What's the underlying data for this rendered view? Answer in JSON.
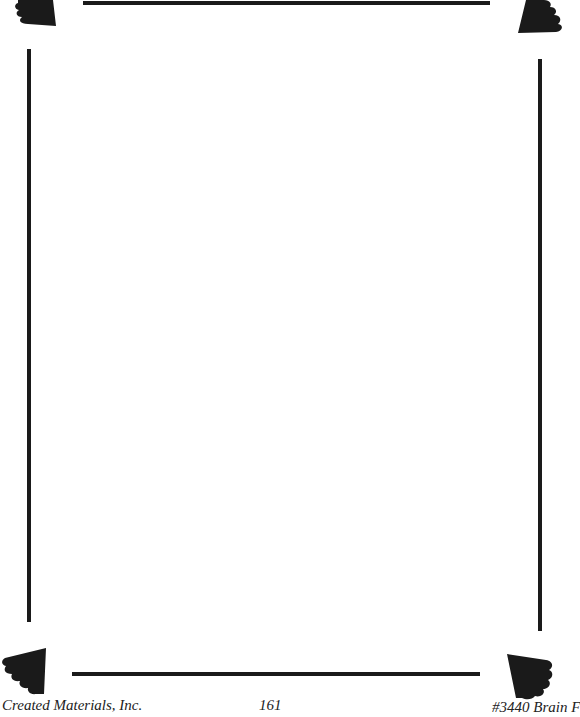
{
  "page": {
    "border_color": "#1a1a1a",
    "background": "#ffffff"
  },
  "footer": {
    "publisher": "Created Materials, Inc.",
    "page_number": "161",
    "product_code": "#3440 Brain F"
  },
  "decorations": {
    "corners": [
      "top-left-scallop",
      "top-right-scallop",
      "bottom-left-scallop",
      "bottom-right-scallop"
    ]
  }
}
